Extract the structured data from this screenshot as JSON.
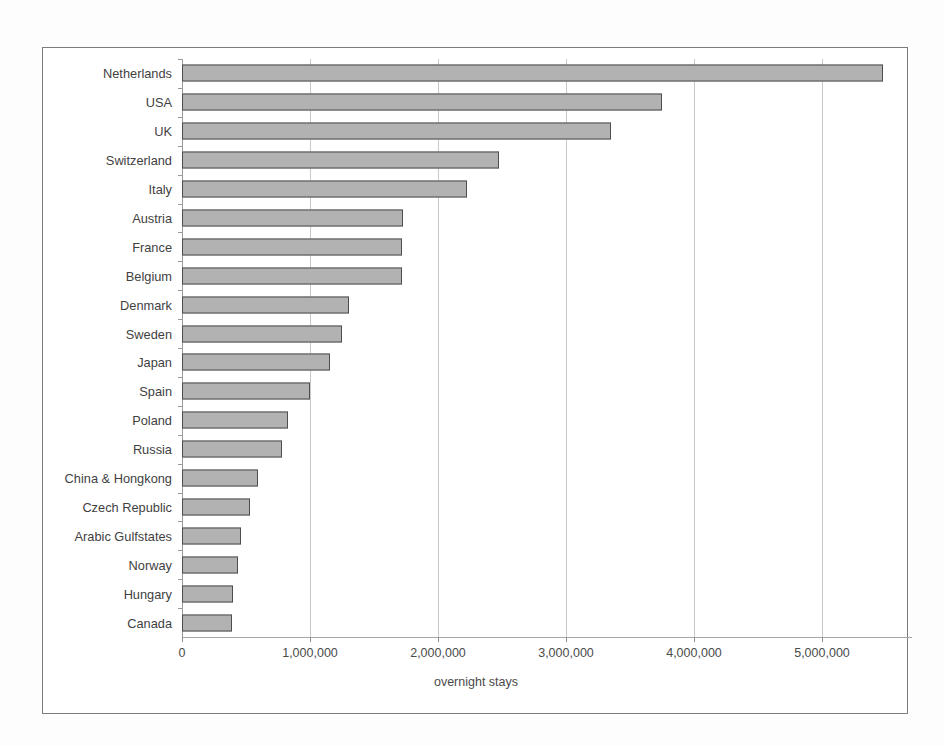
{
  "figure": {
    "xaxis_title": "overnight stays"
  },
  "chart_data": {
    "type": "bar",
    "orientation": "horizontal",
    "title": "",
    "xlabel": "overnight stays",
    "ylabel": "",
    "xlim": [
      0,
      5600000
    ],
    "grid": true,
    "legend": false,
    "tick_labels": [
      "0",
      "1,000,000",
      "2,000,000",
      "3,000,000",
      "4,000,000",
      "5,000,000"
    ],
    "ticks": [
      0,
      1000000,
      2000000,
      3000000,
      4000000,
      5000000
    ],
    "categories": [
      "Netherlands",
      "USA",
      "UK",
      "Switzerland",
      "Italy",
      "Austria",
      "France",
      "Belgium",
      "Denmark",
      "Sweden",
      "Japan",
      "Spain",
      "Poland",
      "Russia",
      "China & Hongkong",
      "Czech Republic",
      "Arabic Gulfstates",
      "Norway",
      "Hungary",
      "Canada"
    ],
    "values": [
      5480000,
      3750000,
      3350000,
      2480000,
      2230000,
      1730000,
      1720000,
      1715000,
      1305000,
      1250000,
      1160000,
      1000000,
      825000,
      780000,
      595000,
      535000,
      460000,
      440000,
      395000,
      390000
    ],
    "series": [
      {
        "name": "overnight stays",
        "values": [
          5480000,
          3750000,
          3350000,
          2480000,
          2230000,
          1730000,
          1720000,
          1715000,
          1305000,
          1250000,
          1160000,
          1000000,
          825000,
          780000,
          595000,
          535000,
          460000,
          440000,
          395000,
          390000
        ]
      }
    ],
    "colors": {
      "bar_fill": "#b2b2b2",
      "bar_edge": "#4d4d4d",
      "gridline": "#c9c9c9",
      "frame": "#7c7c7c",
      "text": "#3f3f3f"
    }
  }
}
